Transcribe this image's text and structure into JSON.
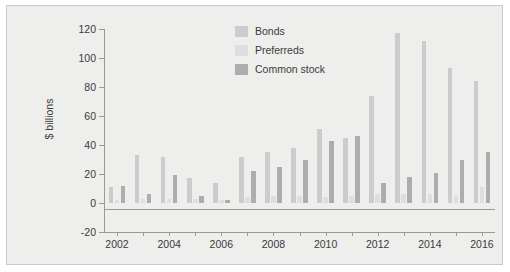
{
  "chart_data": {
    "type": "bar",
    "title": "",
    "xlabel": "",
    "ylabel": "$ billions",
    "ylim": [
      -20,
      120
    ],
    "yticks": [
      -20,
      0,
      20,
      40,
      60,
      80,
      100,
      120
    ],
    "xlim": [
      2001.5,
      2016.5
    ],
    "categories": [
      2002,
      2003,
      2004,
      2005,
      2006,
      2007,
      2008,
      2009,
      2010,
      2011,
      2012,
      2013,
      2014,
      2015,
      2016
    ],
    "xtick_labels": [
      "2002",
      "2004",
      "2006",
      "2008",
      "2010",
      "2012",
      "2014",
      "2016"
    ],
    "grid": false,
    "legend_position": "top-center",
    "series": [
      {
        "name": "Bonds",
        "color": "#cccccc",
        "values": [
          11,
          33,
          32,
          17,
          14,
          32,
          35,
          38,
          51,
          45,
          74,
          117,
          112,
          93,
          84
        ]
      },
      {
        "name": "Preferreds",
        "color": "#dedede",
        "values": [
          2,
          3,
          3,
          3,
          2,
          4,
          5,
          5,
          4,
          5,
          6,
          6,
          6,
          5,
          11
        ]
      },
      {
        "name": "Common stock",
        "color": "#adadad",
        "values": [
          12,
          6,
          19,
          5,
          2,
          22,
          25,
          30,
          43,
          46,
          14,
          18,
          21,
          30,
          35
        ]
      }
    ]
  },
  "axis": {
    "y_label": "$ billions"
  },
  "legend": {
    "items": [
      {
        "label": "Bonds",
        "color": "#cccccc"
      },
      {
        "label": "Preferreds",
        "color": "#dedede"
      },
      {
        "label": "Common stock",
        "color": "#adadad"
      }
    ]
  }
}
